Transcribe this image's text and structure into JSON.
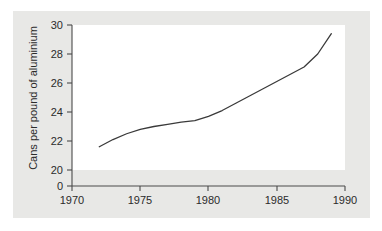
{
  "chart_data": {
    "type": "line",
    "title": "",
    "xlabel": "",
    "ylabel": "Cans per pound of aluminium",
    "xlim": [
      1970,
      1990
    ],
    "ylim": [
      20,
      30
    ],
    "y_axis_has_break_to_zero": true,
    "grid": false,
    "legend": null,
    "xticks": [
      1970,
      1975,
      1980,
      1985,
      1990
    ],
    "xtick_labels": [
      "1970",
      "1975",
      "1980",
      "1985",
      "1990"
    ],
    "yticks": [
      20,
      22,
      24,
      26,
      28,
      30
    ],
    "ytick_labels": [
      "20",
      "22",
      "24",
      "26",
      "28",
      "30"
    ],
    "y_zero_label": "0",
    "series": [
      {
        "name": "Cans per pound of aluminium",
        "x": [
          1972,
          1973,
          1974,
          1975,
          1976,
          1977,
          1978,
          1979,
          1980,
          1981,
          1982,
          1983,
          1984,
          1985,
          1986,
          1987,
          1988,
          1989
        ],
        "values": [
          21.6,
          22.1,
          22.5,
          22.8,
          23.0,
          23.15,
          23.3,
          23.4,
          23.7,
          24.1,
          24.6,
          25.1,
          25.6,
          26.1,
          26.6,
          27.1,
          28.0,
          29.4
        ]
      }
    ]
  },
  "figure": {
    "card_color": "#e8e8e6",
    "plot_color": "#ffffff",
    "line_color": "#3a3a3a",
    "axis_color": "#4a4a4a",
    "text_color": "#2b2b2b"
  }
}
